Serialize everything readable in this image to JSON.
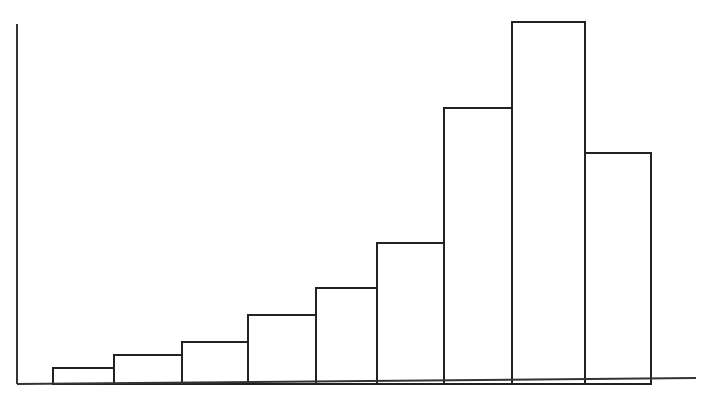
{
  "chart_data": {
    "type": "bar",
    "subtype": "histogram",
    "title": "",
    "xlabel": "",
    "ylabel": "",
    "categories": [
      "1",
      "2",
      "3",
      "4",
      "5",
      "6",
      "7",
      "8",
      "9"
    ],
    "bin_edges_px": [
      53,
      114,
      182,
      248,
      316,
      377,
      444,
      512,
      585,
      651
    ],
    "values": [
      16,
      29,
      42,
      69,
      96,
      141,
      276,
      362,
      231
    ],
    "value_units": "relative height (px, no axis scale shown)",
    "ylim": [
      0,
      362
    ],
    "grid": false,
    "legend": null,
    "fill_color": "#ffffff",
    "stroke_color": "#222222"
  },
  "axes": {
    "y_axis": {
      "x": 17,
      "top": 24,
      "bottom": 384
    },
    "x_axis": {
      "y": 384,
      "left": 17,
      "right": 696
    }
  }
}
